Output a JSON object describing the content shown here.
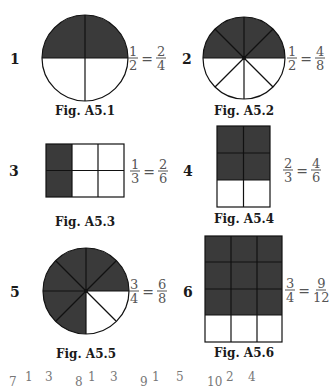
{
  "colors": {
    "shade": "#3a3a3a",
    "line": "#111111",
    "fraction_text": "#555555"
  },
  "figures": [
    {
      "number": "1",
      "caption": "Fig. A5.1",
      "shape": "circle",
      "parts": 4,
      "shaded": 2,
      "equation": {
        "left_num": "1",
        "left_den": "2",
        "equals": "=",
        "right_num": "2",
        "right_den": "4"
      }
    },
    {
      "number": "2",
      "caption": "Fig. A5.2",
      "shape": "circle",
      "parts": 8,
      "shaded": 4,
      "equation": {
        "left_num": "1",
        "left_den": "2",
        "equals": "=",
        "right_num": "4",
        "right_den": "8"
      }
    },
    {
      "number": "3",
      "caption": "Fig. A5.3",
      "shape": "rectangle",
      "cols": 3,
      "rows": 2,
      "shaded": 2,
      "equation": {
        "left_num": "1",
        "left_den": "3",
        "equals": "=",
        "right_num": "2",
        "right_den": "6"
      }
    },
    {
      "number": "4",
      "caption": "Fig. A5.4",
      "shape": "rectangle",
      "cols": 2,
      "rows": 3,
      "shaded": 4,
      "equation": {
        "left_num": "2",
        "left_den": "3",
        "equals": "=",
        "right_num": "4",
        "right_den": "6"
      }
    },
    {
      "number": "5",
      "caption": "Fig. A5.5",
      "shape": "circle",
      "parts": 8,
      "shaded": 6,
      "equation": {
        "left_num": "3",
        "left_den": "4",
        "equals": "=",
        "right_num": "6",
        "right_den": "8"
      }
    },
    {
      "number": "6",
      "caption": "Fig. A5.6",
      "shape": "rectangle",
      "cols": 3,
      "rows": 4,
      "shaded": 9,
      "equation": {
        "left_num": "3",
        "left_den": "4",
        "equals": "=",
        "right_num": "9",
        "right_den": "12"
      }
    }
  ],
  "footer_fragments": [
    "7",
    "1",
    "3",
    "8",
    "1",
    "3",
    "9",
    "1",
    "5",
    "10",
    "2",
    "4"
  ]
}
